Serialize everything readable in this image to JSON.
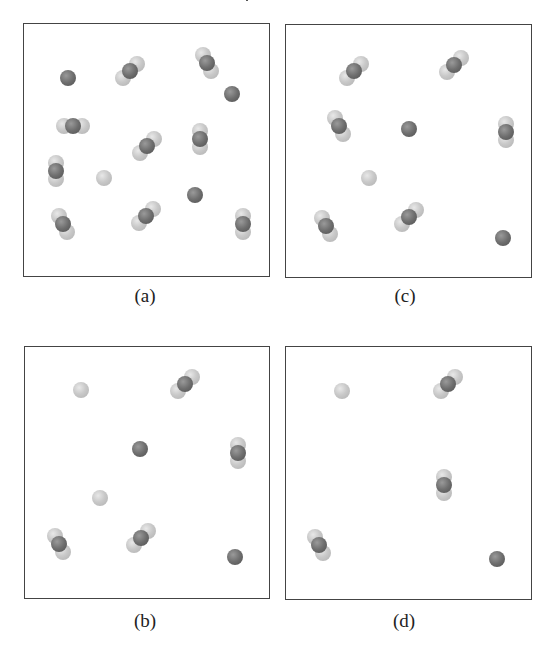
{
  "figure": {
    "top_fragment": "|",
    "panels": [
      {
        "id": "a",
        "label": "(a)",
        "box": {
          "x": 23,
          "y": 23,
          "w": 247,
          "h": 254
        },
        "label_pos": {
          "x": 115,
          "y": 285
        },
        "triatomic_molecules": [
          {
            "x": 129,
            "y": 70,
            "orient": "diag"
          },
          {
            "x": 206,
            "y": 62,
            "orient": "vdiag"
          },
          {
            "x": 72,
            "y": 125,
            "orient": "horiz"
          },
          {
            "x": 146,
            "y": 145,
            "orient": "diag"
          },
          {
            "x": 199,
            "y": 138,
            "orient": "vert"
          },
          {
            "x": 55,
            "y": 170,
            "orient": "vert"
          },
          {
            "x": 62,
            "y": 223,
            "orient": "vdiag"
          },
          {
            "x": 145,
            "y": 215,
            "orient": "diag"
          },
          {
            "x": 242,
            "y": 223,
            "orient": "vert"
          }
        ],
        "dark_atoms": [
          {
            "x": 67,
            "y": 77
          },
          {
            "x": 231,
            "y": 93
          },
          {
            "x": 194,
            "y": 194
          }
        ],
        "light_atoms": [
          {
            "x": 103,
            "y": 177
          }
        ]
      },
      {
        "id": "c",
        "label": "(c)",
        "box": {
          "x": 285,
          "y": 24,
          "w": 247,
          "h": 254
        },
        "label_pos": {
          "x": 375,
          "y": 285
        },
        "triatomic_molecules": [
          {
            "x": 353,
            "y": 70,
            "orient": "diag"
          },
          {
            "x": 453,
            "y": 64,
            "orient": "diag"
          },
          {
            "x": 338,
            "y": 125,
            "orient": "vdiag"
          },
          {
            "x": 505,
            "y": 131,
            "orient": "vert"
          },
          {
            "x": 325,
            "y": 225,
            "orient": "vdiag"
          },
          {
            "x": 408,
            "y": 216,
            "orient": "diag"
          }
        ],
        "dark_atoms": [
          {
            "x": 408,
            "y": 128
          },
          {
            "x": 502,
            "y": 237
          }
        ],
        "light_atoms": [
          {
            "x": 368,
            "y": 177
          }
        ]
      },
      {
        "id": "b",
        "label": "(b)",
        "box": {
          "x": 24,
          "y": 346,
          "w": 246,
          "h": 253
        },
        "label_pos": {
          "x": 115,
          "y": 610
        },
        "triatomic_molecules": [
          {
            "x": 184,
            "y": 383,
            "orient": "diag"
          },
          {
            "x": 237,
            "y": 452,
            "orient": "vert"
          },
          {
            "x": 58,
            "y": 543,
            "orient": "vdiag"
          },
          {
            "x": 140,
            "y": 537,
            "orient": "diag"
          }
        ],
        "dark_atoms": [
          {
            "x": 139,
            "y": 448
          },
          {
            "x": 234,
            "y": 556
          }
        ],
        "light_atoms": [
          {
            "x": 80,
            "y": 389
          },
          {
            "x": 99,
            "y": 497
          }
        ]
      },
      {
        "id": "d",
        "label": "(d)",
        "box": {
          "x": 285,
          "y": 346,
          "w": 247,
          "h": 254
        },
        "label_pos": {
          "x": 374,
          "y": 610
        },
        "triatomic_molecules": [
          {
            "x": 447,
            "y": 383,
            "orient": "diag"
          },
          {
            "x": 443,
            "y": 484,
            "orient": "vert"
          },
          {
            "x": 318,
            "y": 544,
            "orient": "vdiag"
          }
        ],
        "dark_atoms": [
          {
            "x": 496,
            "y": 558
          }
        ],
        "light_atoms": [
          {
            "x": 341,
            "y": 390
          }
        ]
      }
    ],
    "legend_semantics": {
      "triatomic": "light–dark–light three-atom molecule",
      "dark_atom": "single dark atom",
      "light_atom": "single light atom"
    },
    "counts": {
      "a": {
        "triatomic": 9,
        "dark_single": 3,
        "light_single": 1
      },
      "c": {
        "triatomic": 6,
        "dark_single": 2,
        "light_single": 1
      },
      "b": {
        "triatomic": 4,
        "dark_single": 2,
        "light_single": 2
      },
      "d": {
        "triatomic": 3,
        "dark_single": 1,
        "light_single": 1
      }
    },
    "colors": {
      "light_atom": "#c4c4c4",
      "dark_atom": "#6e6e6e",
      "border": "#444444",
      "background": "#ffffff"
    }
  }
}
